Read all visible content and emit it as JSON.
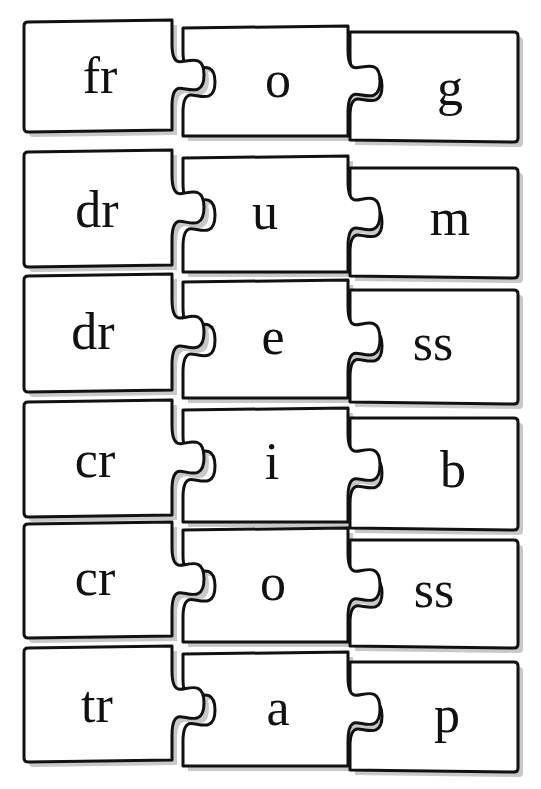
{
  "worksheet": {
    "type": "word-building puzzle",
    "rows": [
      {
        "onset": "fr",
        "vowel": "o",
        "ending": "g"
      },
      {
        "onset": "dr",
        "vowel": "u",
        "ending": "m"
      },
      {
        "onset": "dr",
        "vowel": "e",
        "ending": "ss"
      },
      {
        "onset": "cr",
        "vowel": "i",
        "ending": "b"
      },
      {
        "onset": "cr",
        "vowel": "o",
        "ending": "ss"
      },
      {
        "onset": "tr",
        "vowel": "a",
        "ending": "p"
      }
    ]
  },
  "colors": {
    "background": "#ffffff",
    "outline": "#111111",
    "shadow": "#c8c8c8",
    "text": "#111111"
  }
}
